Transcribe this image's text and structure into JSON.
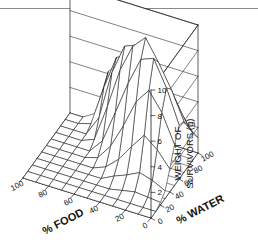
{
  "figure": {
    "type": "3d-surface-wireframe",
    "background_color": "#ffffff",
    "line_color": "#1a1a1a",
    "rule_color": "#8a8a8a",
    "has_top_rule": true
  },
  "chart_data": {
    "type": "surface",
    "title": "",
    "xlabel": "% FOOD",
    "ylabel": "% WATER",
    "zlabel_line1": "WEIGHT OF",
    "zlabel_line2": "SURVIVORS (g)",
    "xlim": [
      0,
      100
    ],
    "ylim": [
      0,
      100
    ],
    "zlim": [
      0,
      10
    ],
    "xticks": [
      100,
      80,
      60,
      40,
      20,
      0
    ],
    "yticks": [
      0,
      20,
      40,
      60,
      80,
      100
    ],
    "zticks": [
      2,
      4,
      6,
      8,
      10
    ],
    "xtick_labels": [
      "100",
      "80",
      "60",
      "40",
      "20",
      "0"
    ],
    "ytick_labels": [
      "0",
      "20",
      "40",
      "60",
      "80",
      "100"
    ],
    "ztick_labels": [
      "2",
      "4",
      "6",
      "8",
      "10"
    ],
    "grid": true,
    "legend": "none",
    "x_values": [
      0,
      10,
      20,
      30,
      40,
      50,
      60,
      70,
      80,
      90,
      100
    ],
    "y_values": [
      0,
      10,
      20,
      30,
      40,
      50,
      60,
      70,
      80,
      90,
      100
    ],
    "z_matrix": [
      [
        0,
        0,
        0,
        0,
        0,
        0,
        0,
        0,
        0,
        0,
        0
      ],
      [
        0,
        0,
        0,
        0,
        0,
        0,
        0,
        0,
        0,
        0,
        0
      ],
      [
        0,
        0,
        0,
        0,
        0,
        0,
        0,
        0,
        0,
        0.3,
        0.6
      ],
      [
        0,
        0,
        0,
        0,
        0,
        0,
        0,
        0.4,
        1.6,
        3.4,
        4.2
      ],
      [
        0,
        0,
        0,
        0,
        0,
        0.3,
        1.1,
        3.2,
        5.4,
        6.1,
        5.2
      ],
      [
        0,
        0,
        0,
        0,
        0.4,
        1.5,
        3.6,
        6.4,
        7.8,
        6.6,
        4.8
      ],
      [
        0,
        0,
        0,
        0.5,
        1.3,
        3.4,
        6.2,
        8.6,
        8.2,
        6.0,
        4.0
      ],
      [
        0,
        0,
        0.2,
        0.9,
        2.6,
        5.6,
        8.4,
        9.6,
        7.4,
        5.2,
        3.4
      ],
      [
        0,
        0,
        0.4,
        1.4,
        3.8,
        6.8,
        8.8,
        8.0,
        6.2,
        4.4,
        2.8
      ],
      [
        0,
        0,
        0.3,
        1.1,
        3.0,
        5.4,
        6.8,
        6.2,
        4.8,
        3.4,
        2.0
      ],
      [
        0,
        0,
        0.2,
        0.6,
        1.8,
        3.2,
        4.2,
        4.0,
        3.0,
        2.0,
        1.2
      ]
    ]
  }
}
